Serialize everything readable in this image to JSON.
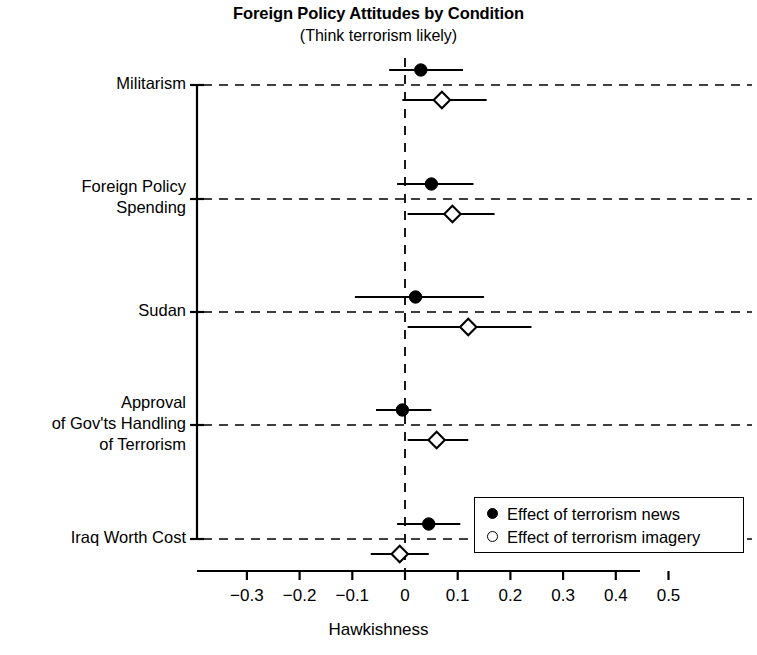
{
  "chart_data": {
    "type": "scatter",
    "title": "Foreign Policy Attitudes by Condition",
    "subtitle": "(Think terrorism likely)",
    "xlabel": "Hawkishness",
    "ylabel": "",
    "xlim": [
      -0.395,
      0.545
    ],
    "xticks": [
      -0.3,
      -0.2,
      -0.1,
      0,
      0.1,
      0.2,
      0.3,
      0.4,
      0.5
    ],
    "xtick_labels": [
      "−0.3",
      "−0.2",
      "−0.1",
      "0",
      "0.1",
      "0.2",
      "0.3",
      "0.4",
      "0.5"
    ],
    "grid": "horizontal-dashed",
    "zero_line": 0,
    "legend_position": "bottom-right",
    "categories": [
      "Militarism",
      "Foreign Policy\nSpending",
      "Sudan",
      "Approval\nof Gov'ts Handling\nof Terrorism",
      "Iraq Worth Cost"
    ],
    "series": [
      {
        "name": "Effect of terrorism news",
        "marker": "filled-circle",
        "color": "#000000",
        "values": [
          0.03,
          0.05,
          0.02,
          -0.005,
          0.045
        ],
        "ci_low": [
          -0.03,
          -0.015,
          -0.095,
          -0.055,
          -0.015
        ],
        "ci_high": [
          0.11,
          0.13,
          0.15,
          0.05,
          0.105
        ]
      },
      {
        "name": "Effect of terrorism imagery",
        "marker": "open-diamond",
        "color": "#000000",
        "values": [
          0.07,
          0.09,
          0.12,
          0.06,
          -0.01
        ],
        "ci_low": [
          -0.005,
          0.005,
          0.005,
          0.005,
          -0.065
        ],
        "ci_high": [
          0.155,
          0.17,
          0.24,
          0.12,
          0.045
        ]
      }
    ]
  },
  "legend": {
    "items": [
      {
        "label": "Effect of terrorism news",
        "marker": "filled-circle"
      },
      {
        "label": "Effect of terrorism imagery",
        "marker": "open-circle"
      }
    ]
  }
}
